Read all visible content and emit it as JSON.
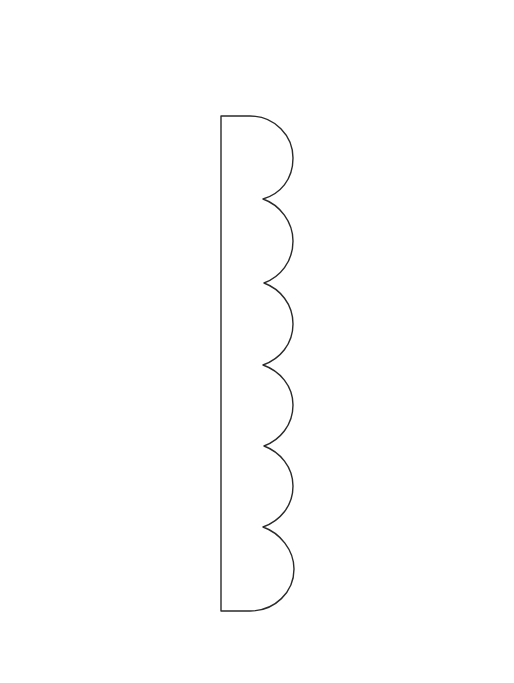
{
  "figure": {
    "stroke_color": "#2a2a2a",
    "background": "#ffffff",
    "scallop_count": 6
  }
}
